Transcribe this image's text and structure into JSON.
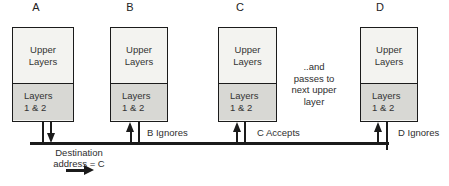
{
  "stacks": [
    {
      "label": "A",
      "upper": [
        "Upper",
        "Layers"
      ],
      "lower": [
        "Layers",
        "1 & 2"
      ],
      "arrow": "down"
    },
    {
      "label": "B",
      "upper": [
        "Upper",
        "Layers"
      ],
      "lower": [
        "Layers",
        "1 & 2"
      ],
      "arrow": "up",
      "note": "B Ignores"
    },
    {
      "label": "C",
      "upper": [
        "Upper",
        "Layers"
      ],
      "lower": [
        "Layers",
        "1 & 2"
      ],
      "arrow": "up",
      "note": "C Accepts"
    },
    {
      "label": "D",
      "upper": [
        "Upper",
        "Layers"
      ],
      "lower": [
        "Layers",
        "1 & 2"
      ],
      "arrow": "up",
      "note": "D Ignores"
    }
  ],
  "annotations": {
    "passes_note": [
      "..and",
      "passes to",
      "next upper",
      "layer"
    ],
    "destination": [
      "Destination",
      "address = C"
    ]
  },
  "colors": {
    "card_upper_bg": "#f3f3f0",
    "card_lower_bg": "#d8d8d4",
    "ink": "#1b1b1b",
    "text": "#2e2e2e",
    "background": "#ffffff"
  }
}
